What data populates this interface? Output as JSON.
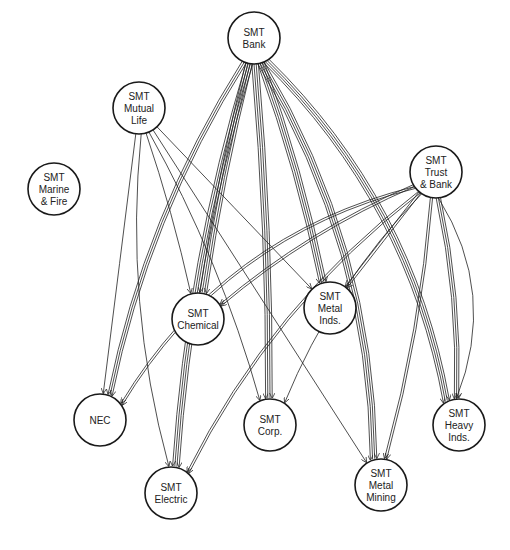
{
  "diagram": {
    "type": "directed-network",
    "colors": {
      "stroke": "#1a1a1a",
      "background": "#ffffff"
    },
    "node_radius": 26,
    "nodes": [
      {
        "id": "bank",
        "lines": [
          "SMT",
          "Bank"
        ],
        "x": 254,
        "y": 38
      },
      {
        "id": "mutual_life",
        "lines": [
          "SMT",
          "Mutual",
          "Life"
        ],
        "x": 139,
        "y": 108
      },
      {
        "id": "marine_fire",
        "lines": [
          "SMT",
          "Marine",
          "& Fire"
        ],
        "x": 54,
        "y": 189
      },
      {
        "id": "trust_bank",
        "lines": [
          "SMT",
          "Trust",
          "& Bank"
        ],
        "x": 436,
        "y": 172
      },
      {
        "id": "chemical",
        "lines": [
          "SMT",
          "Chemical"
        ],
        "x": 198,
        "y": 319
      },
      {
        "id": "metal_inds",
        "lines": [
          "SMT",
          "Metal",
          "Inds."
        ],
        "x": 330,
        "y": 308
      },
      {
        "id": "nec",
        "lines": [
          "NEC"
        ],
        "x": 100,
        "y": 420
      },
      {
        "id": "corp",
        "lines": [
          "SMT",
          "Corp."
        ],
        "x": 270,
        "y": 425
      },
      {
        "id": "heavy_inds",
        "lines": [
          "SMT",
          "Heavy",
          "Inds."
        ],
        "x": 459,
        "y": 425
      },
      {
        "id": "electric",
        "lines": [
          "SMT",
          "Electric"
        ],
        "x": 171,
        "y": 493
      },
      {
        "id": "metal_mining",
        "lines": [
          "SMT",
          "Metal",
          "Mining"
        ],
        "x": 381,
        "y": 485
      }
    ],
    "edges": [
      {
        "from": "bank",
        "to": "nec",
        "strands": 3,
        "bend": 0.08
      },
      {
        "from": "bank",
        "to": "electric",
        "strands": 4,
        "bend": 0.05
      },
      {
        "from": "bank",
        "to": "chemical",
        "strands": 4,
        "bend": 0.02
      },
      {
        "from": "bank",
        "to": "corp",
        "strands": 4,
        "bend": -0.02
      },
      {
        "from": "bank",
        "to": "metal_inds",
        "strands": 4,
        "bend": -0.03
      },
      {
        "from": "bank",
        "to": "metal_mining",
        "strands": 4,
        "bend": -0.12
      },
      {
        "from": "bank",
        "to": "heavy_inds",
        "strands": 4,
        "bend": -0.14
      },
      {
        "from": "mutual_life",
        "to": "electric",
        "strands": 1,
        "bend": 0.08
      },
      {
        "from": "mutual_life",
        "to": "nec",
        "strands": 1,
        "bend": 0.0
      },
      {
        "from": "mutual_life",
        "to": "chemical",
        "strands": 1,
        "bend": -0.02
      },
      {
        "from": "mutual_life",
        "to": "metal_inds",
        "strands": 1,
        "bend": 0.0
      },
      {
        "from": "mutual_life",
        "to": "corp",
        "strands": 1,
        "bend": -0.05
      },
      {
        "from": "mutual_life",
        "to": "metal_mining",
        "strands": 1,
        "bend": 0.0
      },
      {
        "from": "trust_bank",
        "to": "nec",
        "strands": 2,
        "bend": 0.18
      },
      {
        "from": "trust_bank",
        "to": "chemical",
        "strands": 2,
        "bend": 0.06
      },
      {
        "from": "trust_bank",
        "to": "electric",
        "strands": 2,
        "bend": 0.1
      },
      {
        "from": "trust_bank",
        "to": "metal_inds",
        "strands": 2,
        "bend": 0.0
      },
      {
        "from": "trust_bank",
        "to": "corp",
        "strands": 1,
        "bend": 0.08
      },
      {
        "from": "trust_bank",
        "to": "metal_mining",
        "strands": 2,
        "bend": -0.04
      },
      {
        "from": "trust_bank",
        "to": "heavy_inds",
        "strands": 3,
        "bend": -0.05
      },
      {
        "from": "trust_bank",
        "to": "heavy_inds",
        "strands": 1,
        "bend": -0.2
      }
    ]
  }
}
